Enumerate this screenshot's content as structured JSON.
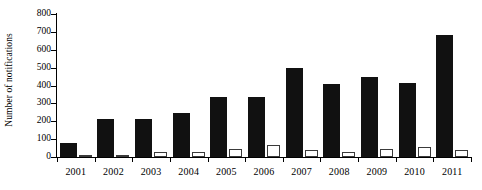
{
  "chart_data": {
    "type": "bar",
    "title": "",
    "subtitle": "",
    "xlabel": "",
    "ylabel": "Number of notifications",
    "ylim": [
      0,
      800
    ],
    "ytick_step": 100,
    "yticks": [
      0,
      100,
      200,
      300,
      400,
      500,
      600,
      700,
      800
    ],
    "ytick_labels": [
      "0",
      "100",
      "200",
      "300",
      "400",
      "500",
      "600",
      "700",
      "800"
    ],
    "grid": false,
    "legend": false,
    "legend_position": "none",
    "categories": [
      "2001",
      "2002",
      "2003",
      "2004",
      "2005",
      "2006",
      "2007",
      "2008",
      "2009",
      "2010",
      "2011"
    ],
    "series": [
      {
        "name": "series-black",
        "style": "filled",
        "color": "#111111",
        "values": [
          78,
          215,
          212,
          245,
          335,
          335,
          500,
          408,
          447,
          412,
          680
        ]
      },
      {
        "name": "series-white",
        "style": "outlined",
        "color": "#ffffff",
        "edge_color": "#3a3a3a",
        "values": [
          9,
          9,
          30,
          27,
          43,
          70,
          42,
          27,
          47,
          58,
          41
        ]
      }
    ]
  },
  "axes": {
    "y_title": "Number of notifications"
  }
}
